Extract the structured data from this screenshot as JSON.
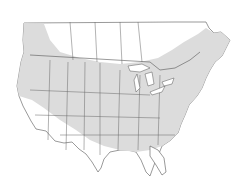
{
  "map": {
    "type": "species-range-map",
    "region": "North America (Canada, USA, northern Mexico border)",
    "colors": {
      "background": "#ffffff",
      "land": "#ffffff",
      "range": "#dcdcdc",
      "borders": "#555555"
    },
    "legend": "none shown",
    "range_description": "Shaded range covering most of the contiguous US (excluding the desert Southwest, southern Texas and peninsular Florida) and southern Canada from British Columbia east to the Maritimes and Newfoundland"
  }
}
